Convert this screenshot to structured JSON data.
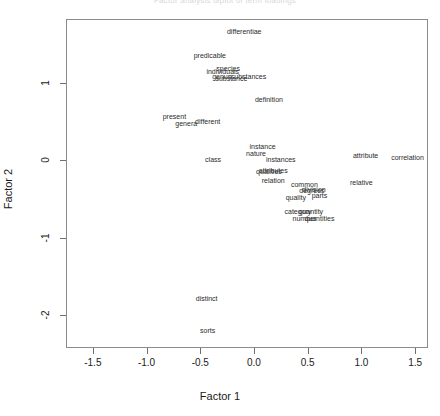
{
  "title_fragment": "Factor analysis biplot of term loadings",
  "axes": {
    "xlabel": "Factor 1",
    "ylabel": "Factor 2",
    "xticks": [
      -1.5,
      -1.0,
      -0.5,
      0.0,
      0.5,
      1.0,
      1.5
    ],
    "xticklabels": [
      "-1.5",
      "-1.0",
      "-0.5",
      "0.0",
      "0.5",
      "1.0",
      "1.5"
    ],
    "yticks": [
      -2,
      -1,
      0,
      1
    ],
    "yticklabels": [
      "-2",
      "-1",
      "0",
      "1"
    ]
  },
  "chart_data": {
    "type": "scatter",
    "title": "",
    "xlabel": "Factor 1",
    "ylabel": "Factor 2",
    "xlim": [
      -1.75,
      1.62
    ],
    "ylim": [
      -2.42,
      1.82
    ],
    "grid": false,
    "legend": "none",
    "point_marker": "text-label",
    "labels": [
      "differentiae",
      "predicable",
      "individuals",
      "species",
      "genus",
      "substance",
      "substances",
      "definition",
      "present",
      "genera",
      "different",
      "instance",
      "nature",
      "class",
      "instances",
      "qualities",
      "attributes",
      "relation",
      "common",
      "degrees",
      "division",
      "quality",
      "parts",
      "category",
      "quantity",
      "number",
      "quantities",
      "attribute",
      "correlation",
      "relative",
      "distinct",
      "sorts"
    ],
    "x": [
      -0.1,
      -0.42,
      -0.3,
      -0.25,
      -0.31,
      -0.22,
      -0.06,
      0.13,
      -0.75,
      -0.64,
      -0.44,
      0.07,
      0.01,
      -0.39,
      0.24,
      0.13,
      0.17,
      0.17,
      0.46,
      0.53,
      0.55,
      0.38,
      0.6,
      0.4,
      0.52,
      0.46,
      0.6,
      1.03,
      1.42,
      0.99,
      -0.45,
      -0.44
    ],
    "y": [
      1.66,
      1.36,
      1.15,
      1.19,
      1.09,
      1.06,
      1.08,
      0.79,
      0.57,
      0.48,
      0.5,
      0.18,
      0.09,
      0.02,
      0.01,
      -0.14,
      -0.13,
      -0.26,
      -0.31,
      -0.39,
      -0.37,
      -0.47,
      -0.45,
      -0.65,
      -0.65,
      -0.75,
      -0.74,
      0.07,
      0.04,
      -0.28,
      -1.77,
      -2.19
    ]
  }
}
